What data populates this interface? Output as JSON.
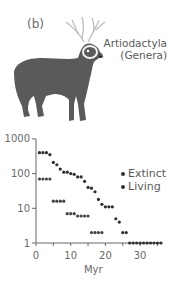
{
  "figure": {
    "panel_label": "(b)",
    "title_line1": "Artiodactyla",
    "title_line2": "(Genera)",
    "illustration": "deer-silhouette"
  },
  "legend": {
    "items": [
      {
        "label": "Extinct",
        "color": "#2e2e2e"
      },
      {
        "label": "Living",
        "color": "#444444"
      }
    ]
  },
  "axes": {
    "xlabel": "Myr",
    "x_ticks": [
      "0",
      "10",
      "20",
      "30"
    ],
    "y_ticks": [
      "1",
      "10",
      "100",
      "1000"
    ]
  },
  "chart_data": {
    "type": "scatter",
    "title": "Artiodactyla (Genera)",
    "xlabel": "Myr",
    "ylabel": "",
    "xlim": [
      0,
      37
    ],
    "ylim": [
      1,
      1000
    ],
    "yscale": "log",
    "grid": false,
    "legend_position": "right",
    "x_tick_labels": [
      "0",
      "10",
      "20",
      "30"
    ],
    "y_tick_labels": [
      "1",
      "10",
      "100",
      "1000"
    ],
    "series": [
      {
        "name": "Extinct",
        "x": [
          1,
          2,
          3,
          4,
          5,
          6,
          7,
          8,
          9,
          10,
          11,
          12,
          13,
          14,
          15,
          16,
          17,
          18,
          19,
          20,
          21,
          22,
          23,
          24,
          25,
          26,
          27,
          28,
          29,
          30,
          31,
          32,
          33,
          34,
          35,
          36
        ],
        "y": [
          400,
          400,
          400,
          350,
          210,
          180,
          135,
          110,
          110,
          100,
          95,
          80,
          80,
          60,
          40,
          38,
          30,
          18,
          13,
          11,
          11,
          11,
          5,
          4,
          2,
          2,
          1,
          1,
          1,
          1,
          1,
          1,
          1,
          1,
          1,
          1
        ]
      },
      {
        "name": "Living",
        "x": [
          1,
          2,
          3,
          4,
          5,
          6,
          7,
          8,
          9,
          10,
          11,
          12,
          13,
          14,
          15,
          16,
          17,
          18,
          19
        ],
        "y": [
          70,
          70,
          70,
          70,
          16,
          16,
          16,
          16,
          7,
          7,
          7,
          6,
          6,
          6,
          6,
          2,
          2,
          2,
          2
        ]
      }
    ]
  }
}
